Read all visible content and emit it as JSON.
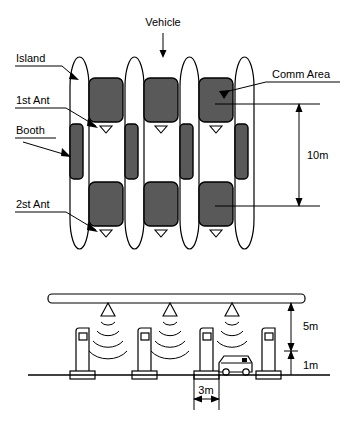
{
  "figure": {
    "colors": {
      "line": "#000000",
      "comm_area_fill": "#595959",
      "booth_fill": "#595959",
      "background": "#ffffff"
    }
  },
  "top_view": {
    "labels": {
      "vehicle": "Vehicle",
      "island": "Island",
      "first_antenna": "1st Ant",
      "booth": "Booth",
      "second_antenna": "2st Ant",
      "comm_area": "Comm Area"
    },
    "dimensions": [
      {
        "name": "comm-area-span",
        "value": "10m",
        "orientation": "vertical"
      }
    ],
    "counts": {
      "islands": 4,
      "lanes": 3,
      "booths": 4,
      "comm_areas": 6,
      "antenna_markers": 6
    },
    "icons": {
      "vehicle_arrow": "down-arrow-icon",
      "antenna_marker": "antenna-triangle-icon",
      "leader_arrow": "leader-arrow-icon",
      "dimension_arrow": "dimension-double-arrow-icon"
    }
  },
  "side_view": {
    "dimensions": [
      {
        "name": "gantry-height",
        "value": "5m",
        "orientation": "vertical"
      },
      {
        "name": "vehicle-height",
        "value": "1m",
        "orientation": "vertical"
      },
      {
        "name": "lane-width",
        "value": "3m",
        "orientation": "horizontal"
      }
    ],
    "counts": {
      "booths": 4,
      "antennas": 3,
      "wave_arcs_per_antenna": 4,
      "vehicles": 1
    },
    "icons": {
      "gantry": "gantry-beam-icon",
      "antenna": "antenna-triangle-icon",
      "radio_waves": "radio-wave-icon",
      "booth": "toll-booth-icon",
      "vehicle": "car-icon",
      "ground": "ground-line-icon"
    }
  }
}
